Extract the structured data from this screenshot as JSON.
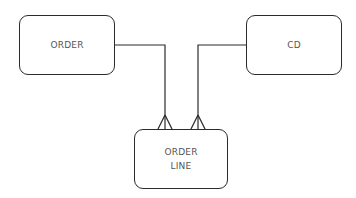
{
  "diagram": {
    "type": "entity-relationship",
    "entities": [
      {
        "id": "order",
        "label": "ORDER"
      },
      {
        "id": "cd",
        "label": "CD"
      },
      {
        "id": "orderline",
        "label": "ORDER\nLINE"
      }
    ],
    "relationships": [
      {
        "from": "order",
        "to": "orderline",
        "from_cardinality": "one",
        "to_cardinality": "many"
      },
      {
        "from": "cd",
        "to": "orderline",
        "from_cardinality": "one",
        "to_cardinality": "many"
      }
    ],
    "colors": {
      "line": "#2b2b2b",
      "text": "#555555",
      "background": "#ffffff"
    }
  }
}
